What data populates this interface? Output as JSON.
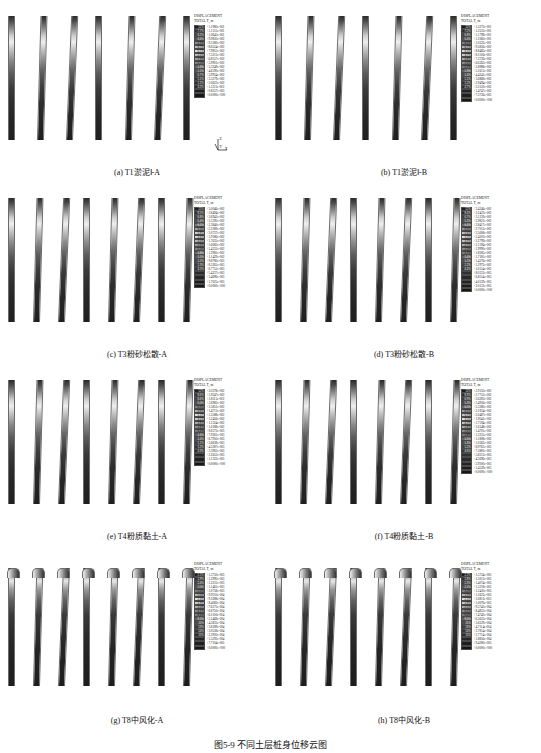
{
  "figure": {
    "title": "图5-9  不同土层桩身位移云图",
    "legend_title_line1": "DISPLACEMENT",
    "legend_title_line2": "TOTAL T,  m",
    "axis_triad": {
      "z": "Z",
      "y": "Y",
      "x": "X"
    }
  },
  "panels": [
    {
      "id": "a",
      "caption": "(a) T1淤泥Ⅰ-A",
      "pile_count": 7,
      "bent": false,
      "legend": {
        "percents": [
          "12%",
          "7.7%",
          "6.2%",
          "4.6%",
          "5.3%",
          "8.7%",
          "6.7%",
          "2.2%",
          "7.3%",
          "2.2%",
          "1.3%",
          "1.1%",
          "0.7%",
          "1.1%",
          "1.1%",
          "4.2%"
        ],
        "values": [
          "+1.1980e-001",
          "+1.1315e-001",
          "+1.0645e-001",
          "+9.9830e-002",
          "+9.3180e-002",
          "+8.6524e-002",
          "+7.9855e-002",
          "+7.3213e-002",
          "+6.8557e-002",
          "+5.9901e-002",
          "+5.3249e-002",
          "+4.6590e-002",
          "+3.9934e-002",
          "+3.3279e-002",
          "+2.0623e-002",
          "+1.3311e-002",
          "+0.8557e-003",
          "+0.0000e+000"
        ]
      }
    },
    {
      "id": "b",
      "caption": "(b) T1淤泥Ⅰ-B",
      "pile_count": 7,
      "bent": false,
      "legend": {
        "percents": [
          "11%",
          "7.2%",
          "6.8%",
          "5.4%",
          "8.2%",
          "6.7%",
          "6.3%",
          "3.7%",
          "4.8%",
          "2.4%",
          "2.7%",
          "1.9%",
          "1.4%",
          "1.1%",
          "1.2%",
          "4.7%"
        ],
        "values": [
          "+1.3272e-001",
          "+1.2535e-001",
          "+1.1798e-001",
          "+1.1060e-001",
          "+1.0322e-001",
          "+9.5856e-002",
          "+8.8483e-002",
          "+8.1106e-002",
          "+7.3736e-002",
          "+6.6362e-002",
          "+5.8988e-002",
          "+5.1613e-002",
          "+4.4241e-002",
          "+3.6868e-002",
          "+2.9494e-002",
          "+2.2120e-002",
          "+1.4747e-002",
          "+7.3736e-003",
          "+0.0000e+000"
        ]
      }
    },
    {
      "id": "c",
      "caption": "(c) T3粉砂松散-A",
      "pile_count": 8,
      "bent": false,
      "legend": {
        "percents": [
          "11%",
          "8.5%",
          "6.8%",
          "5.4%",
          "6.1%",
          "8.4%",
          "5.8%",
          "3.4%",
          "4.0%",
          "2.6%",
          "2.5%",
          "1.8%",
          "1.5%",
          "1.2%",
          "1.3%",
          "4.5%"
        ],
        "values": [
          "+3.0046e-002",
          "+2.8494e-002",
          "+2.6943e-002",
          "+2.5392e-002",
          "+2.3840e-002",
          "+2.2289e-002",
          "+2.0737e-002",
          "+1.9186e-002",
          "+1.7635e-002",
          "+1.6083e-002",
          "+1.4532e-002",
          "+1.2981e-002",
          "+1.1429e-002",
          "+9.8780e-003",
          "+8.3265e-003",
          "+6.7751e-003",
          "+5.4237e-003",
          "+3.4696e-003",
          "+1.7025e-003",
          "+0.0000e+000"
        ]
      }
    },
    {
      "id": "d",
      "caption": "(d) T3粉砂松散-B",
      "pile_count": 8,
      "bent": false,
      "legend": {
        "percents": [
          "12%",
          "8.4%",
          "6.7%",
          "5.2%",
          "6.4%",
          "8.6%",
          "5.6%",
          "3.3%",
          "3.9%",
          "2.7%",
          "2.3%",
          "1.7%",
          "1.4%",
          "1.2%",
          "1.2%",
          "4.4%"
        ],
        "values": [
          "+3.4246e-002",
          "+3.2423e-002",
          "+3.1239e-002",
          "+2.9821e-002",
          "+2.8417e-002",
          "+2.7012e-002",
          "+2.5608e-002",
          "+2.4203e-002",
          "+2.2799e-002",
          "+2.1394e-002",
          "+1.9990e-002",
          "+1.8585e-002",
          "+1.7181e-002",
          "+1.4376e-002",
          "+1.2972e-002",
          "+1.0154e-002",
          "+8.0333e-003",
          "+6.8514e-003",
          "+4.0139e-003",
          "+2.0131e-003",
          "+0.0000e+000"
        ]
      }
    },
    {
      "id": "e",
      "caption": "(e) T4粉质黏土-A",
      "pile_count": 8,
      "bent": false,
      "legend": {
        "percents": [
          "12%",
          "8.6%",
          "6.6%",
          "5.0%",
          "6.3%",
          "8.8%",
          "5.5%",
          "3.2%",
          "3.8%",
          "2.8%",
          "2.2%",
          "1.6%",
          "1.4%",
          "1.1%",
          "1.2%",
          "4.3%"
        ],
        "values": [
          "+2.0378e-002",
          "+1.9247e-002",
          "+1.8115e-002",
          "+1.6983e-002",
          "+1.5851e-002",
          "+1.4713e-002",
          "+1.3588e-002",
          "+1.2456e-002",
          "+1.1324e-002",
          "+1.0188e-002",
          "+9.0573e-003",
          "+7.9261e-003",
          "+6.7950e-003",
          "+5.6638e-003",
          "+4.5287e-003",
          "+3.3963e-003",
          "+2.2652e-003",
          "+1.1322e-003",
          "+0.0000e+000"
        ]
      }
    },
    {
      "id": "f",
      "caption": "(f) T4粉质黏土-B",
      "pile_count": 8,
      "bent": false,
      "legend": {
        "percents": [
          "11%",
          "8.3%",
          "6.9%",
          "5.3%",
          "6.2%",
          "8.5%",
          "5.7%",
          "3.5%",
          "4.1%",
          "2.6%",
          "2.4%",
          "1.8%",
          "1.5%",
          "1.3%",
          "1.2%",
          "4.6%"
        ],
        "values": [
          "+2.9150e-002",
          "+2.7752e-002",
          "+2.6283e-002",
          "+2.4936e-002",
          "+2.3380e-002",
          "+2.1934e-002",
          "+2.0487e-002",
          "+1.9041e-002",
          "+1.7594e-002",
          "+1.6148e-002",
          "+1.4701e-002",
          "+1.3255e-002",
          "+1.1808e-002",
          "+1.0362e-002",
          "+8.9761e-003",
          "+7.5881e-003",
          "+5.8313e-003",
          "+4.3696e-003",
          "+2.9200e-003",
          "+1.4539e-003",
          "+0.0000e+000"
        ]
      }
    },
    {
      "id": "g",
      "caption": "(g) T8中风化-A",
      "pile_count": 8,
      "bent": true,
      "legend": {
        "percents": [
          "2.1%",
          "1.9%",
          "2.4%",
          "2.0%",
          "2.0%",
          "2.0%",
          "2.0%",
          "1.9%",
          "2.0%",
          "6.1%",
          "8.3%",
          "9.1%",
          "11%",
          "13%",
          "14%",
          "11%"
        ],
        "values": [
          "+1.3750e-003",
          "+1.2990e-003",
          "+1.2231e-003",
          "+1.1461e-003",
          "+1.0758e-003",
          "+9.9310e-004",
          "+9.1698e-004",
          "+8.4060e-004",
          "+7.6375e-004",
          "+6.8750e-004",
          "+6.1100e-004",
          "+5.3468e-004",
          "+4.5835e-004",
          "+3.8189e-004",
          "+3.0538e-004",
          "+2.2920e-004",
          "+1.5292e-004",
          "+7.7104e-005",
          "+0.0000e+000"
        ]
      }
    },
    {
      "id": "h",
      "caption": "(h) T8中风化-B",
      "pile_count": 8,
      "bent": true,
      "legend": {
        "percents": [
          "2.2%",
          "1.8%",
          "2.3%",
          "2.1%",
          "2.0%",
          "1.9%",
          "2.1%",
          "1.8%",
          "2.1%",
          "6.0%",
          "8.4%",
          "9.0%",
          "11%",
          "13%",
          "14%",
          "11%"
        ],
        "values": [
          "+1.5734e-003",
          "+1.5013e-003",
          "+1.4074e-003",
          "+1.3218e-003",
          "+1.2430e-003",
          "+1.1623e-003",
          "+1.0811e-003",
          "+1.0076e-003",
          "+9.3745e-004",
          "+8.4853e-004",
          "+7.4742e-004",
          "+6.5633e-004",
          "+5.6529e-004",
          "+4.7114e-004",
          "+3.7814e-004",
          "+2.7714e-004",
          "+1.8856e-004",
          "+9.4280e-005",
          "+0.0000e+000"
        ]
      }
    }
  ]
}
